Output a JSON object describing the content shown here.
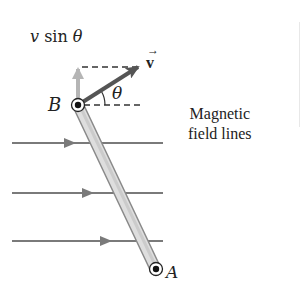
{
  "diagram": {
    "type": "physics-motional-emf",
    "labels": {
      "v_sin_theta_v": "v",
      "v_sin_theta_rest": " sin ",
      "v_sin_theta_theta": "θ",
      "velocity_vector": "v",
      "velocity_arrow_glyph": "→",
      "angle": "θ",
      "point_B": "B",
      "point_A": "A",
      "field_label_line1": "Magnetic",
      "field_label_line2": "field lines"
    },
    "colors": {
      "field_line": "#7a7a7a",
      "velocity_vector": "#555555",
      "vertical_component": "#b5b5b5",
      "rod_fill": "#d6d6d6",
      "rod_edge": "#8a8a8a",
      "dashed": "#333333",
      "text": "#222222"
    },
    "geometry": {
      "point_B": [
        78,
        105
      ],
      "point_A": [
        156,
        270
      ],
      "velocity_tip": [
        138,
        67
      ],
      "vertical_component_tip": [
        78,
        67
      ],
      "field_lines_y": [
        143,
        193,
        241
      ],
      "field_lines_x_range": [
        12,
        163
      ]
    }
  }
}
